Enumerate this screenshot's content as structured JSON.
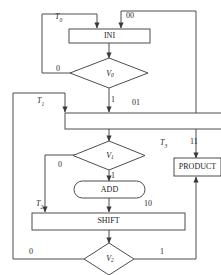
{
  "diagram": {
    "nodes": {
      "ini": "INI",
      "add": "ADD",
      "shift": "SHIFT",
      "product": "PRODUCT",
      "blank_box": ""
    },
    "decisions": {
      "v0": {
        "name": "V",
        "sub": "0"
      },
      "v1": {
        "name": "V",
        "sub": "1"
      },
      "v2": {
        "name": "V",
        "sub": "2"
      }
    },
    "state_labels": {
      "t0": {
        "name": "T",
        "sub": "0"
      },
      "t1": {
        "name": "T",
        "sub": "1"
      },
      "t2": {
        "name": "T",
        "sub": "2"
      },
      "t3": {
        "name": "T",
        "sub": "3"
      }
    },
    "state_codes": {
      "code_00": "00",
      "code_01": "01",
      "code_10": "10",
      "code_11": "11"
    },
    "branch_labels": {
      "v0_false": "0",
      "v0_true": "1",
      "v1_false": "0",
      "v1_true": "1",
      "v2_false": "0",
      "v2_true": "1"
    },
    "colors": {
      "stroke": "#4d4d4d",
      "text": "#1a1a1a",
      "background": "#ffffff"
    }
  }
}
